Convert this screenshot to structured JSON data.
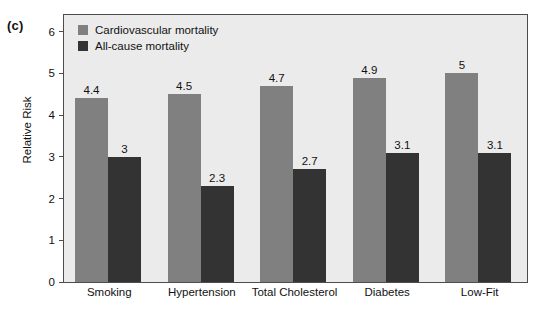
{
  "panel": {
    "label": "(c)"
  },
  "chart_data": {
    "type": "bar",
    "title": "",
    "subtitle": "",
    "xlabel": "",
    "ylabel": "Relative Risk",
    "ylim": [
      0,
      6.4
    ],
    "yticks": [
      0,
      1,
      2,
      3,
      4,
      5,
      6
    ],
    "ytick_labels": [
      "0",
      "1",
      "2",
      "3",
      "4",
      "5",
      "6"
    ],
    "grid": false,
    "legend_position": "top-left-inside",
    "categories": [
      "Smoking",
      "Hypertension",
      "Total Cholesterol",
      "Diabetes",
      "Low-Fit"
    ],
    "series": [
      {
        "name": "Cardiovascular mortality",
        "color": "#808080",
        "values": [
          4.4,
          4.5,
          4.7,
          4.9,
          5
        ],
        "value_labels": [
          "4.4",
          "4.5",
          "4.7",
          "4.9",
          "5"
        ]
      },
      {
        "name": "All-cause mortality",
        "color": "#333333",
        "values": [
          3,
          2.3,
          2.7,
          3.1,
          3.1
        ],
        "value_labels": [
          "3",
          "2.3",
          "2.7",
          "3.1",
          "3.1"
        ]
      }
    ],
    "colors": {
      "plot_background": "#ebebeb",
      "figure_background": "#ffffff",
      "axis": "#4d4d4d",
      "text": "#111111",
      "series_cardiovascular": "#808080",
      "series_all_cause": "#333333"
    }
  }
}
